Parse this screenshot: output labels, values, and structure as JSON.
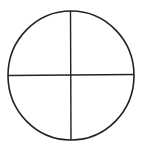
{
  "diagram": {
    "shape": "circle-divided-into-quadrants",
    "stroke_color": "#222222",
    "background": "#ffffff",
    "circle": {
      "cx": 71,
      "cy": 75.5,
      "rx": 63,
      "ry": 64.5,
      "stroke_width": 1.6
    },
    "dividers": [
      {
        "orientation": "vertical",
        "x1": 70.5,
        "y1": 11,
        "x2": 71,
        "y2": 140
      },
      {
        "orientation": "horizontal",
        "x1": 8,
        "y1": 75.5,
        "x2": 134,
        "y2": 74.5
      }
    ],
    "quadrants": 4
  }
}
